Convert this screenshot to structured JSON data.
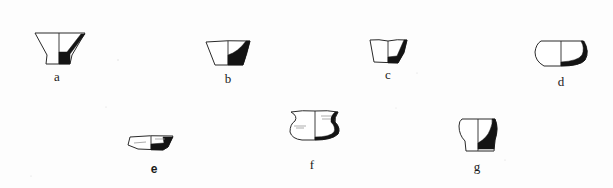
{
  "figure": {
    "type": "pottery-profile-plate",
    "background": "#fdfdfd",
    "ink_color": "#141414",
    "vessels": [
      {
        "id": "a",
        "label": "a",
        "label_x": 57,
        "label_y": 70,
        "shape": "pedestal-cup"
      },
      {
        "id": "b",
        "label": "b",
        "label_x": 228,
        "label_y": 72,
        "shape": "conical-bowl"
      },
      {
        "id": "c",
        "label": "c",
        "label_x": 388,
        "label_y": 68,
        "shape": "straight-walled-cup"
      },
      {
        "id": "d",
        "label": "d",
        "label_x": 561,
        "label_y": 75,
        "shape": "shallow-rounded-dish"
      },
      {
        "id": "e",
        "label": "e",
        "label_x": 154,
        "label_y": 162,
        "shape": "shallow-tray"
      },
      {
        "id": "f",
        "label": "f",
        "label_x": 312,
        "label_y": 158,
        "shape": "s-profile-jar"
      },
      {
        "id": "g",
        "label": "g",
        "label_x": 477,
        "label_y": 160,
        "shape": "necked-cup"
      }
    ]
  }
}
